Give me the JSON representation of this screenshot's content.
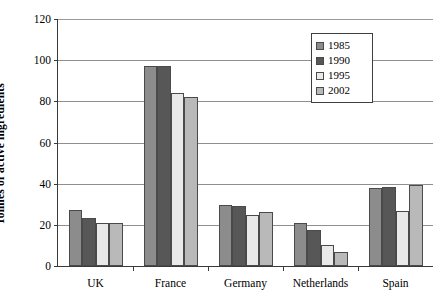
{
  "chart_data": {
    "type": "bar",
    "title": "",
    "subtitle": "",
    "xlabel": "",
    "ylabel": "Tonnes of active ingredients",
    "ylim": [
      0,
      120
    ],
    "yticks": [
      0,
      20,
      40,
      60,
      80,
      100,
      120
    ],
    "ytick_labels": [
      "0",
      "20",
      "40",
      "60",
      "80",
      "100",
      "120"
    ],
    "grid": "horizontal",
    "legend_position": "top-right-inside",
    "categories": [
      "UK",
      "France",
      "Germany",
      "Netherlands",
      "Spain"
    ],
    "series": [
      {
        "name": "1985",
        "color": "#8c8c8c",
        "values": [
          27,
          97,
          29.5,
          21,
          38
        ]
      },
      {
        "name": "1990",
        "color": "#575757",
        "values": [
          23.5,
          97,
          29,
          17.5,
          38.5
        ]
      },
      {
        "name": "1995",
        "color": "#e9e9e9",
        "values": [
          21,
          84,
          25,
          10,
          26.5
        ]
      },
      {
        "name": "2002",
        "color": "#b9b9b9",
        "values": [
          21,
          82,
          26,
          7,
          39.5
        ]
      }
    ]
  },
  "legend": {
    "items": [
      {
        "label": "1985",
        "color": "#8c8c8c"
      },
      {
        "label": "1990",
        "color": "#575757"
      },
      {
        "label": "1995",
        "color": "#e9e9e9"
      },
      {
        "label": "2002",
        "color": "#b9b9b9"
      }
    ]
  },
  "axis_colors": {
    "axis_line": "#3a3a3a",
    "gridline": "#8f8f8f",
    "bar_outline": "#4a4a4a"
  }
}
